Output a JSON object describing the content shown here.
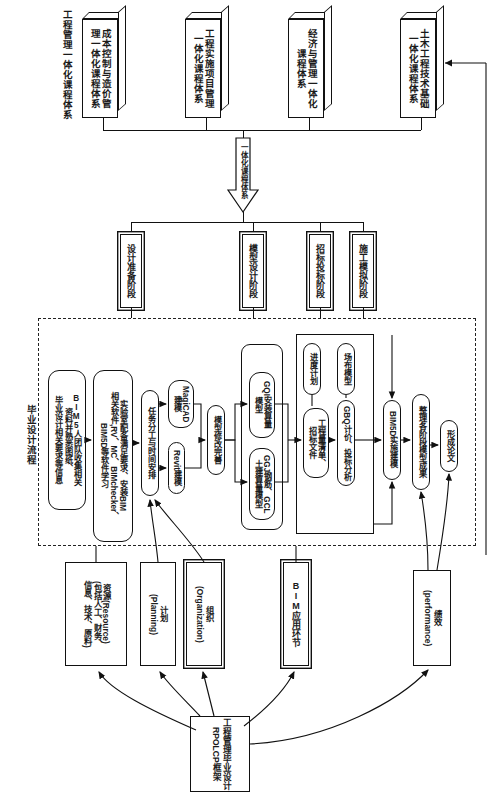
{
  "diagram": {
    "title_vertical": "工程管理毕业设计RPOLCP框架",
    "process_group_label": "毕业设计流程",
    "integration_arrow_label": "一体化课程体系"
  },
  "course_systems": [
    {
      "id": "cs-cost",
      "label": "成本控制与造价管\n理一体化课程体系"
    },
    {
      "id": "cs-project",
      "label": "工程实施项目管理\n一体化课程体系"
    },
    {
      "id": "cs-economics",
      "label": "经济与管理一体化\n课程体系"
    },
    {
      "id": "cs-civil-tech",
      "label": "土木工程技术基础\n一体化课程体系"
    }
  ],
  "course_systems_header": "工程管理一体化课程体系",
  "stages": [
    {
      "id": "stage-prep",
      "label": "设计准备阶段"
    },
    {
      "id": "stage-model",
      "label": "模型设计阶段"
    },
    {
      "id": "stage-bidding",
      "label": "招标投标阶段"
    },
    {
      "id": "stage-construct",
      "label": "施工模拟阶段"
    }
  ],
  "process_nodes": [
    {
      "id": "node-team-collect",
      "label": "BIM5人团队收集相关\n资料并熟悉图纸、\n毕业设计相关要求等信息"
    },
    {
      "id": "node-lab-software",
      "label": "实验室配备满足要求、安装BIM\n相关软件,RV、MC、BIMchecker、\nBIM5D等软件学习"
    },
    {
      "id": "node-task-schedule",
      "label": "任务分工与时间安排"
    },
    {
      "id": "node-magicad",
      "label": "MagiCAD\n建模"
    },
    {
      "id": "node-revit",
      "label": "Revit建模"
    },
    {
      "id": "node-model-refine",
      "label": "模型修改完善"
    },
    {
      "id": "node-gqi",
      "label": "GQI安装算量\n模型"
    },
    {
      "id": "node-ggj-gcl",
      "label": "GGJ钢筋、GCL\n土建算量模型"
    },
    {
      "id": "node-boq",
      "label": "工程量清单、\n招标文件"
    },
    {
      "id": "node-gbq",
      "label": "GBQ计价、投标分析"
    },
    {
      "id": "node-schedule-plan",
      "label": "进度计划"
    },
    {
      "id": "node-site-layout",
      "label": "场布模型"
    },
    {
      "id": "node-bim5d",
      "label": "BIM5D实施建模"
    },
    {
      "id": "node-collect-results",
      "label": "整理各阶段模型成果"
    },
    {
      "id": "node-thesis",
      "label": "形成论文"
    }
  ],
  "framework_nodes": [
    {
      "id": "fw-resource",
      "label": "资源(Resource)\n(包括人工、财务、\n信息、技术、原料)"
    },
    {
      "id": "fw-planning",
      "label": "计划\n(Planning)"
    },
    {
      "id": "fw-organization",
      "label": "组织\n(Organization)"
    },
    {
      "id": "fw-bim",
      "label": "BIM应用环节"
    },
    {
      "id": "fw-performance",
      "label": "绩效\n(performance)"
    }
  ],
  "colors": {
    "stroke": "#111111",
    "background": "#ffffff",
    "dashed": "#222222"
  }
}
